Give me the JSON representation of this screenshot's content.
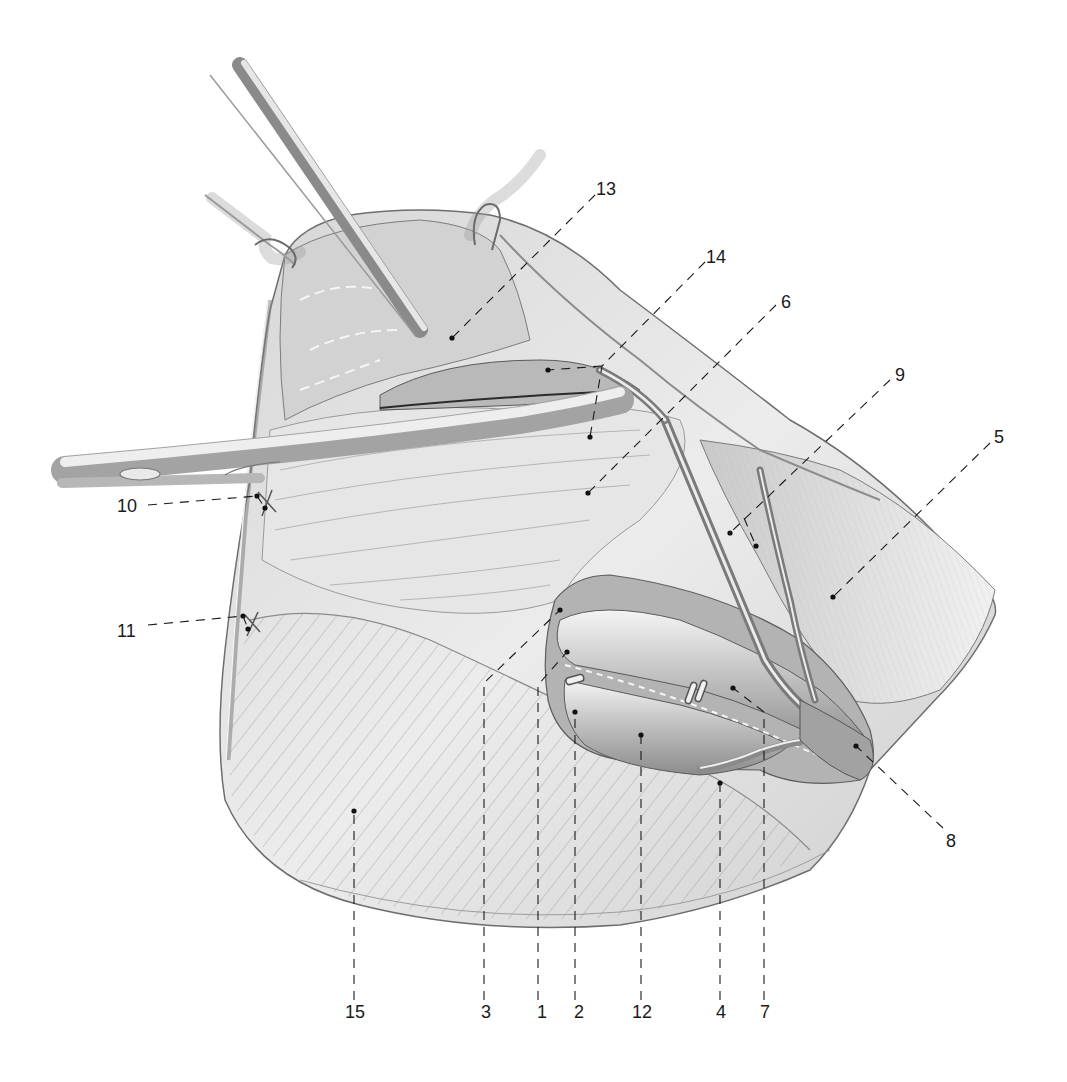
{
  "figure": {
    "type": "anatomical-surgical-illustration",
    "style": "pencil line drawing, grayscale",
    "colors": {
      "background": "#ffffff",
      "ink": "#1a1a1a",
      "tissue_light": "#e9e9e9",
      "tissue_mid": "#cfcfcf",
      "tissue_dark": "#9a9a9a",
      "instrument": "#d8d8d8"
    }
  },
  "labels": [
    {
      "id": "1",
      "text": "1",
      "x": 537,
      "y": 1003,
      "leader": [
        [
          538,
          1000
        ],
        [
          538,
          685
        ],
        [
          567,
          652
        ]
      ]
    },
    {
      "id": "2",
      "text": "2",
      "x": 574,
      "y": 1003,
      "leader": [
        [
          575,
          1000
        ],
        [
          575,
          712
        ]
      ]
    },
    {
      "id": "3",
      "text": "3",
      "x": 481,
      "y": 1003,
      "leader": [
        [
          484,
          1000
        ],
        [
          484,
          683
        ],
        [
          560,
          610
        ]
      ]
    },
    {
      "id": "4",
      "text": "4",
      "x": 716,
      "y": 1003,
      "leader": [
        [
          720,
          1000
        ],
        [
          720,
          783
        ]
      ]
    },
    {
      "id": "5",
      "text": "5",
      "x": 994,
      "y": 428,
      "leader": [
        [
          990,
          443
        ],
        [
          833,
          597
        ]
      ]
    },
    {
      "id": "6",
      "text": "6",
      "x": 781,
      "y": 293,
      "leader": [
        [
          776,
          305
        ],
        [
          588,
          493
        ]
      ]
    },
    {
      "id": "7",
      "text": "7",
      "x": 760,
      "y": 1003,
      "leader": [
        [
          764,
          1000
        ],
        [
          764,
          712
        ],
        [
          733,
          688
        ]
      ]
    },
    {
      "id": "8",
      "text": "8",
      "x": 946,
      "y": 832,
      "leader": [
        [
          943,
          828
        ],
        [
          856,
          746
        ]
      ]
    },
    {
      "id": "9",
      "text": "9",
      "x": 895,
      "y": 366,
      "leader": [
        [
          890,
          380
        ],
        [
          730,
          533
        ]
      ],
      "leader_branch": [
        [
          744,
          518
        ],
        [
          756,
          546
        ]
      ]
    },
    {
      "id": "10",
      "text": "10",
      "x": 117,
      "y": 497,
      "leader": [
        [
          148,
          505
        ],
        [
          257,
          496
        ]
      ],
      "leader_branch": [
        [
          257,
          496
        ],
        [
          265,
          508
        ]
      ]
    },
    {
      "id": "11",
      "text": "11",
      "x": 117,
      "y": 622,
      "leader": [
        [
          148,
          625
        ],
        [
          243,
          616
        ]
      ],
      "leader_branch": [
        [
          243,
          616
        ],
        [
          248,
          629
        ]
      ]
    },
    {
      "id": "12",
      "text": "12",
      "x": 632,
      "y": 1003,
      "leader": [
        [
          641,
          1000
        ],
        [
          641,
          735
        ]
      ]
    },
    {
      "id": "13",
      "text": "13",
      "x": 596,
      "y": 180,
      "leader": [
        [
          595,
          195
        ],
        [
          452,
          338
        ]
      ]
    },
    {
      "id": "14",
      "text": "14",
      "x": 706,
      "y": 248,
      "leader": [
        [
          705,
          262
        ],
        [
          602,
          366
        ],
        [
          590,
          437
        ]
      ],
      "leader_branch": [
        [
          602,
          366
        ],
        [
          548,
          370
        ]
      ]
    },
    {
      "id": "15",
      "text": "15",
      "x": 345,
      "y": 1003,
      "leader": [
        [
          354,
          1000
        ],
        [
          354,
          811
        ]
      ]
    }
  ]
}
